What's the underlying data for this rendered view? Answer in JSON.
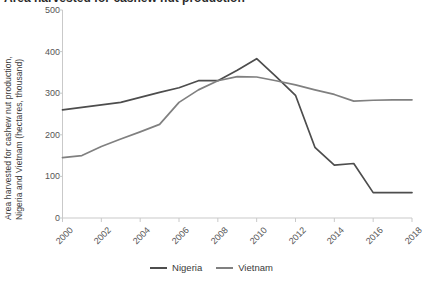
{
  "title": "Area harvested for cashew nut production",
  "axis": {
    "y_label_line1": "Area harvested for cashew nut production,",
    "y_label_line2": "Nigeria and Vietnam (hectares, thousand)",
    "y_ticks": [
      "0",
      "100",
      "200",
      "300",
      "400",
      "500"
    ],
    "x_ticks": [
      "2000",
      "2002",
      "2004",
      "2006",
      "2008",
      "2010",
      "2012",
      "2014",
      "2016",
      "2018"
    ]
  },
  "legend": {
    "items": [
      {
        "label": "Nigeria",
        "color": "#4d4d4d"
      },
      {
        "label": "Vietnam",
        "color": "#808080"
      }
    ]
  },
  "colors": {
    "nigeria": "#4d4d4d",
    "vietnam": "#808080",
    "axis": "#c9c9c9",
    "tick_text": "#555555",
    "label_text": "#3a3a3a"
  },
  "chart_data": {
    "type": "line",
    "title": "Area harvested for cashew nut production",
    "xlabel": "",
    "ylabel": "Area harvested for cashew nut production, Nigeria and Vietnam (hectares, thousand)",
    "xlim": [
      2000,
      2018
    ],
    "ylim": [
      0,
      500
    ],
    "y_ticks": [
      0,
      100,
      200,
      300,
      400,
      500
    ],
    "x_ticks": [
      2000,
      2002,
      2004,
      2006,
      2008,
      2010,
      2012,
      2014,
      2016,
      2018
    ],
    "grid": false,
    "legend_position": "bottom",
    "x": [
      2000,
      2001,
      2002,
      2003,
      2004,
      2005,
      2006,
      2007,
      2008,
      2009,
      2010,
      2011,
      2012,
      2013,
      2014,
      2015,
      2016,
      2017,
      2018
    ],
    "series": [
      {
        "name": "Nigeria",
        "color": "#4d4d4d",
        "values": [
          260,
          266,
          272,
          278,
          290,
          302,
          313,
          330,
          330,
          355,
          383,
          340,
          295,
          170,
          127,
          131,
          61,
          61,
          61
        ]
      },
      {
        "name": "Vietnam",
        "color": "#808080",
        "values": [
          145,
          150,
          172,
          190,
          207,
          225,
          278,
          308,
          330,
          340,
          339,
          330,
          320,
          308,
          297,
          281,
          283,
          284,
          284
        ]
      }
    ]
  }
}
